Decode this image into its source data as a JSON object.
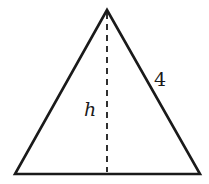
{
  "diagram": {
    "type": "triangle",
    "vertices": {
      "apex": [
        107,
        10
      ],
      "bottom_left": [
        15,
        174
      ],
      "bottom_right": [
        200,
        174
      ]
    },
    "altitude": {
      "label": "h",
      "style": "dashed",
      "from": [
        107,
        12
      ],
      "to": [
        107,
        172
      ]
    },
    "side_label": {
      "side": "right",
      "text": "4"
    },
    "colors": {
      "stroke": "#1a1a1a",
      "background": "#ffffff"
    }
  }
}
